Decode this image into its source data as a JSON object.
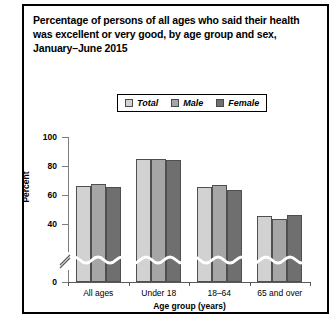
{
  "chart_data": {
    "type": "bar",
    "title": "Percentage of persons of all ages who said their health was excellent or very good, by age group and sex, January–June 2015",
    "title_lines": [
      "Percentage of persons of all ages who said their health",
      "was excellent or very good, by age group and sex,",
      "January–June 2015"
    ],
    "xlabel": "Age group (years)",
    "ylabel": "Percent",
    "categories": [
      "All ages",
      "Under 18",
      "18–64",
      "65 and over"
    ],
    "series": [
      {
        "name": "Total",
        "values": [
          66.4,
          84.5,
          65.3,
          45.5
        ],
        "color": "#d2d2d2"
      },
      {
        "name": "Male",
        "values": [
          67.4,
          84.6,
          66.8,
          43.6
        ],
        "color": "#a6a6a6"
      },
      {
        "name": "Female",
        "values": [
          65.5,
          84.4,
          63.8,
          46.0
        ],
        "color": "#6f6f6f"
      }
    ],
    "ylim": [
      0,
      100
    ],
    "yticks": [
      0,
      40,
      60,
      80,
      100
    ],
    "ytick_labels": [
      "0",
      "40",
      "60",
      "80",
      "100"
    ],
    "axis_break": true,
    "axis_break_between": [
      0,
      40
    ],
    "grid": false,
    "legend_position": "top-center",
    "legend_entries": [
      "Total",
      "Male",
      "Female"
    ]
  },
  "legend": {
    "items": [
      {
        "label": "Total"
      },
      {
        "label": "Male"
      },
      {
        "label": "Female"
      }
    ]
  }
}
